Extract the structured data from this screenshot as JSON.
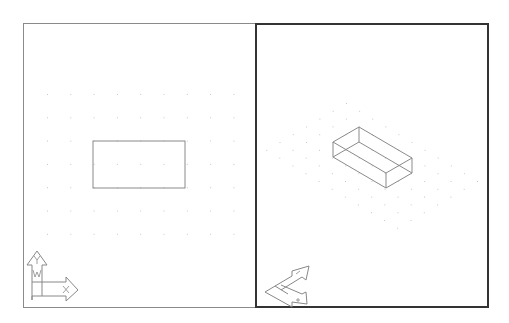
{
  "app": {
    "layout": "two tiled viewports",
    "active_viewport": "right"
  },
  "colors": {
    "background": "#ffffff",
    "inactive_border": "#8a8a8a",
    "active_border": "#333333",
    "geometry": "#777777",
    "grid": "#c8c8c8"
  },
  "viewports": [
    {
      "name": "left",
      "view": "Plan (Top)",
      "active": false,
      "ucs_icon": {
        "x_label": "X",
        "y_label": "Y",
        "w_label": "W"
      },
      "object": {
        "type": "rectangle",
        "x1": 93,
        "y1": 141,
        "x2": 185,
        "y2": 188
      },
      "grid": {
        "x_start": 47,
        "y_start": 94,
        "spacing": 23.3,
        "cols": 9,
        "rows": 7
      }
    },
    {
      "name": "right",
      "view": "SE Isometric",
      "active": true,
      "ucs_icon": {
        "x_label": "X",
        "y_label": "Y"
      },
      "object": {
        "type": "box-wireframe"
      },
      "grid": {
        "origin": [
          346,
          103
        ],
        "u": [
          13.1,
          7.8
        ],
        "v": [
          -13.3,
          7.8
        ],
        "a_count": 11,
        "b_count": 7
      }
    }
  ]
}
